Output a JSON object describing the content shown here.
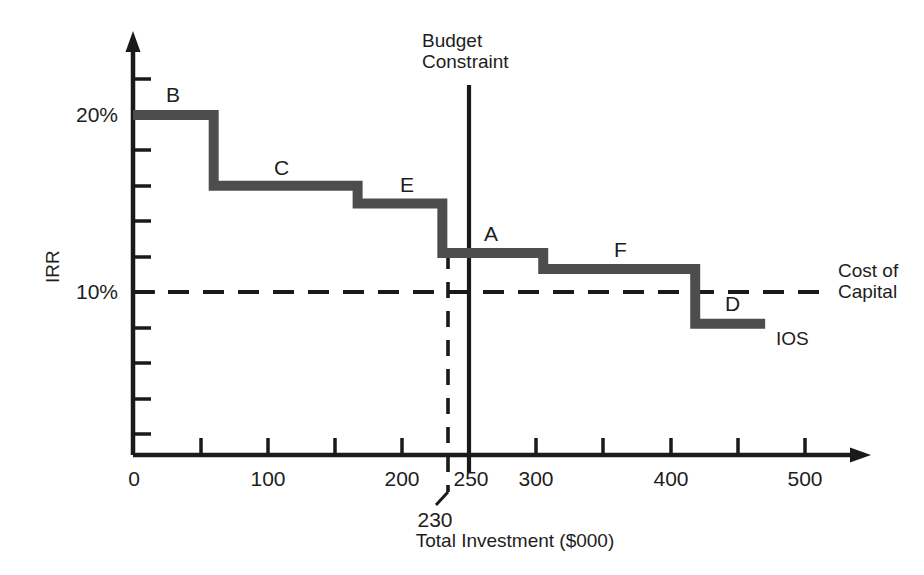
{
  "chart_data": {
    "type": "line",
    "subtype": "step",
    "title": "",
    "xlabel": "Total Investment ($000)",
    "ylabel": "IRR",
    "xlim": [
      0,
      520
    ],
    "ylim": [
      0,
      22
    ],
    "grid": false,
    "legend_position": "inline-annotations",
    "x_ticks": [
      0,
      50,
      100,
      150,
      200,
      230,
      250,
      300,
      350,
      400,
      450,
      500
    ],
    "x_tick_labels": [
      "0",
      "",
      "100",
      "",
      "200",
      "230",
      "250",
      "300",
      "",
      "400",
      "",
      "500"
    ],
    "y_ticks": [
      2,
      4,
      6,
      8,
      10,
      12,
      14,
      16,
      18,
      20,
      22
    ],
    "y_tick_labels": [
      "",
      "",
      "",
      "",
      "10%",
      "",
      "",
      "",
      "",
      "20%",
      ""
    ],
    "series": [
      {
        "name": "IOS",
        "type": "step",
        "label": "IOS",
        "color": "#4d4d4d",
        "steps": [
          {
            "project": "B",
            "x_start": 0,
            "x_end": 60,
            "irr": 20.0
          },
          {
            "project": "C",
            "x_start": 60,
            "x_end": 167,
            "irr": 16.0
          },
          {
            "project": "E",
            "x_start": 167,
            "x_end": 230,
            "irr": 15.0
          },
          {
            "project": "A",
            "x_start": 230,
            "x_end": 305,
            "irr": 12.2
          },
          {
            "project": "F",
            "x_start": 305,
            "x_end": 418,
            "irr": 11.3
          },
          {
            "project": "D",
            "x_start": 418,
            "x_end": 470,
            "irr": 8.2
          }
        ]
      }
    ],
    "reference_lines": [
      {
        "name": "cost-of-capital",
        "orientation": "horizontal",
        "value": 10,
        "label": "Cost of\nCapital",
        "style": "dashed",
        "color": "#1a1a1a"
      },
      {
        "name": "budget-constraint",
        "orientation": "vertical",
        "value": 250,
        "label": "Budget\nConstraint",
        "style": "solid",
        "color": "#1a1a1a"
      },
      {
        "name": "optimal-budget",
        "orientation": "vertical",
        "value": 230,
        "label": "230",
        "style": "dashed",
        "color": "#1a1a1a"
      }
    ]
  },
  "axes": {
    "y_title": "IRR",
    "x_title": "Total Investment ($000)",
    "y_label_20": "20%",
    "y_label_10": "10%",
    "x_label_0": "0",
    "x_label_100": "100",
    "x_label_200": "200",
    "x_label_230": "230",
    "x_label_250": "250",
    "x_label_300": "300",
    "x_label_400": "400",
    "x_label_500": "500"
  },
  "annotations": {
    "step_b": "B",
    "step_c": "C",
    "step_e": "E",
    "step_a": "A",
    "step_f": "F",
    "step_d": "D",
    "ios": "IOS",
    "cost_of_capital_line1": "Cost of",
    "cost_of_capital_line2": "Capital",
    "budget_constraint_line1": "Budget",
    "budget_constraint_line2": "Constraint"
  },
  "colors": {
    "ios_line": "#4d4d4d",
    "axis": "#1a1a1a",
    "text": "#1d1d1d",
    "background": "#ffffff"
  }
}
